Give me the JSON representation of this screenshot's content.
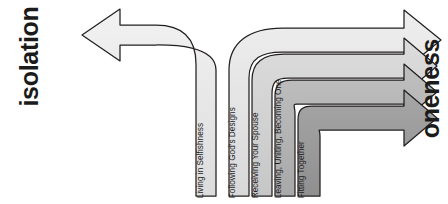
{
  "diagram": {
    "title_left": "isolation",
    "title_right": "oneness",
    "type": "curved-arrow-progression",
    "direction_note": "one band curves left toward isolation; four bands curve right toward oneness",
    "colors": {
      "background": "#ffffff",
      "outline": "#231f20",
      "isolation_band": "#e8e8e8",
      "band_1": "#e3e3e3",
      "band_2": "#d2d2d2",
      "band_3": "#b4b4b4",
      "band_4": "#9a9a9a",
      "text": "#1c1c1c"
    },
    "bands": [
      {
        "id": "isolation",
        "label": "Living in Selfishness",
        "direction": "left",
        "fill": "#e8e8e8"
      },
      {
        "id": "oneness-1",
        "label": "Following God's Designs",
        "direction": "right",
        "fill": "#e3e3e3"
      },
      {
        "id": "oneness-2",
        "label": "Receiving Your Spouse",
        "direction": "right",
        "fill": "#d2d2d2"
      },
      {
        "id": "oneness-3",
        "label": "Leaving, Uniting, Becoming One",
        "direction": "right",
        "fill": "#b4b4b4"
      },
      {
        "id": "oneness-4",
        "label": "Fitting Together",
        "direction": "right",
        "fill": "#9a9a9a"
      }
    ]
  }
}
